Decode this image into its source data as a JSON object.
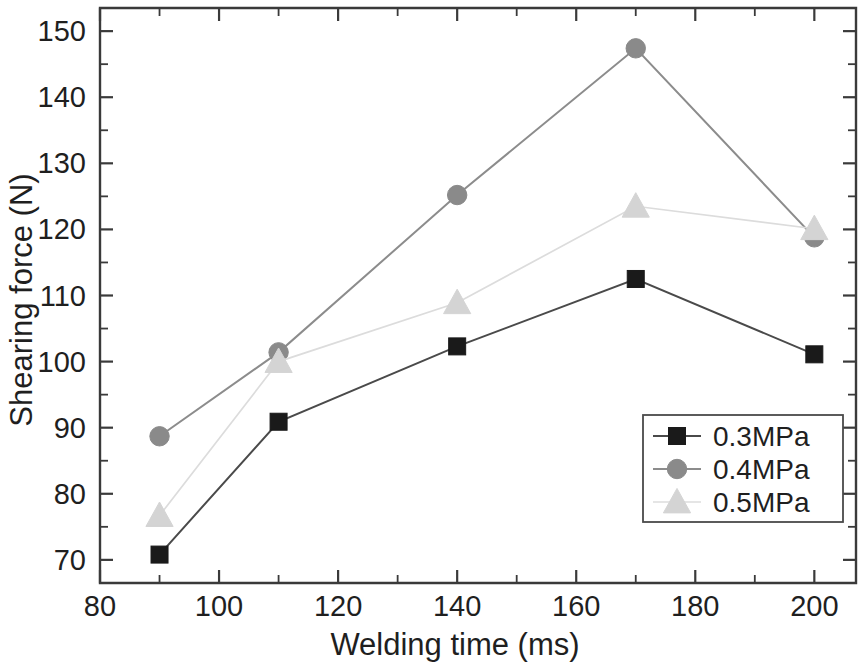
{
  "chart_data": {
    "type": "line",
    "title": "",
    "xlabel": "Welding time (ms)",
    "ylabel": "Shearing force (N)",
    "xlim": [
      80,
      207
    ],
    "ylim": [
      66.5,
      153.5
    ],
    "x_major_ticks": [
      80,
      100,
      120,
      140,
      160,
      180,
      200
    ],
    "x_minor_ticks": [
      90,
      110,
      130,
      150,
      170,
      190
    ],
    "y_major_ticks": [
      70,
      80,
      90,
      100,
      110,
      120,
      130,
      140,
      150
    ],
    "y_minor_ticks": [
      75,
      85,
      95,
      105,
      115,
      125,
      135,
      145
    ],
    "grid": false,
    "legend_position": "lower-right",
    "x": [
      90,
      110,
      140,
      170,
      200
    ],
    "series": [
      {
        "name": "0.3MPa",
        "marker": "square",
        "color": "#1a1a1a",
        "line_color": "#4a4a4a",
        "values": [
          70.8,
          90.9,
          102.3,
          112.5,
          101.1
        ]
      },
      {
        "name": "0.4MPa",
        "marker": "circle",
        "color": "#8a8a8a",
        "line_color": "#8c8c8c",
        "values": [
          88.7,
          101.4,
          125.2,
          147.4,
          118.8
        ]
      },
      {
        "name": "0.5MPa",
        "marker": "triangle",
        "color": "#d4d4d4",
        "line_color": "#dcdcdc",
        "values": [
          76.7,
          100.0,
          108.9,
          123.5,
          120.1
        ]
      }
    ]
  },
  "axes": {
    "x_tick_labels": [
      "80",
      "100",
      "120",
      "140",
      "160",
      "180",
      "200"
    ],
    "y_tick_labels": [
      "70",
      "80",
      "90",
      "100",
      "110",
      "120",
      "130",
      "140",
      "150"
    ],
    "x_title": "Welding time (ms)",
    "y_title": "Shearing force (N)"
  },
  "legend": {
    "entries": [
      {
        "label": "0.3MPa",
        "marker": "square",
        "color": "#1a1a1a"
      },
      {
        "label": "0.4MPa",
        "marker": "circle",
        "color": "#8a8a8a"
      },
      {
        "label": "0.5MPa",
        "marker": "triangle",
        "color": "#d4d4d4"
      }
    ]
  }
}
